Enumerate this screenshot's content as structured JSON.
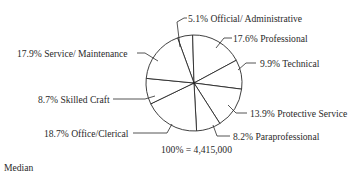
{
  "chart_data": {
    "type": "pie",
    "title": "",
    "total_label": "100% = 4,415,000",
    "total": 4415000,
    "start_angle_deg": -20,
    "direction": "clockwise",
    "slices": [
      {
        "label": "Official/Administrative",
        "value": 5.1,
        "text": "5.1% Official/Administrative"
      },
      {
        "label": "Professional",
        "value": 17.6,
        "text": "17.6% Professional"
      },
      {
        "label": "Technical",
        "value": 9.9,
        "text": "9.9% Technical"
      },
      {
        "label": "Protective Service",
        "value": 13.9,
        "text": "13.9% Protective Service"
      },
      {
        "label": "Paraprofessional",
        "value": 8.2,
        "text": "8.2% Paraprofessional"
      },
      {
        "label": "Office/Clerical",
        "value": 18.7,
        "text": "18.7% Office/Clerical"
      },
      {
        "label": "Skilled Craft",
        "value": 8.7,
        "text": "8.7% Skilled Craft"
      },
      {
        "label": "Service/Maintenance",
        "value": 17.9,
        "text": "17.9% Service/Maintenance"
      }
    ],
    "units": "%"
  },
  "labels": {
    "official": "5.1% Official/ Administrative",
    "professional": "17.6% Professional",
    "technical": "9.9% Technical",
    "protective": "13.9% Protective Service",
    "paraprofessional": "8.2% Paraprofessional",
    "clerical": "18.7% Office/Clerical",
    "craft": "8.7% Skilled Craft",
    "service": "17.9% Service/ Maintenance"
  },
  "total_label": "100% = 4,415,000",
  "footer_text": "Median",
  "colors": {
    "line": "#2a2a2a",
    "fill": "#ffffff"
  }
}
